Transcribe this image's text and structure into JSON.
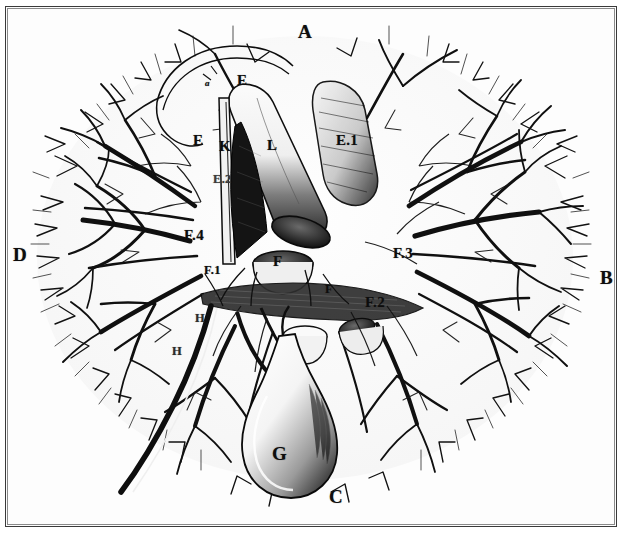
{
  "plate": {
    "kind": "anatomical-engraving",
    "subject": "Liver with hepatic vascular tree and gallbladder",
    "background_color": "#ffffff",
    "ink_color": "#101010",
    "frame_color": "#3a3a3a"
  },
  "labels": {
    "top": {
      "text": "A",
      "x": 298,
      "y": 22
    },
    "right": {
      "text": "B",
      "x": 600,
      "y": 268
    },
    "bottom": {
      "text": "C",
      "x": 329,
      "y": 487
    },
    "left": {
      "text": "D",
      "x": 13,
      "y": 245
    },
    "lobe_e_top": {
      "text": "E",
      "x": 237,
      "y": 73
    },
    "lobe_e_left": {
      "text": "E",
      "x": 193,
      "y": 133
    },
    "duct_e1": {
      "text": "E.1",
      "x": 336,
      "y": 133
    },
    "duct_e2": {
      "text": "E.2",
      "x": 213,
      "y": 173
    },
    "vessel_l": {
      "text": "L",
      "x": 267,
      "y": 138
    },
    "vessel_k": {
      "text": "K",
      "x": 219,
      "y": 139
    },
    "marker_a": {
      "text": "a",
      "x": 205,
      "y": 79
    },
    "branch_f": {
      "text": "F",
      "x": 273,
      "y": 254
    },
    "branch_f_right": {
      "text": "F",
      "x": 325,
      "y": 283
    },
    "branch_f1": {
      "text": "F.1",
      "x": 204,
      "y": 264
    },
    "branch_f2": {
      "text": "F.2",
      "x": 365,
      "y": 295
    },
    "branch_f3": {
      "text": "F.3",
      "x": 393,
      "y": 246
    },
    "branch_f4": {
      "text": "F.4",
      "x": 184,
      "y": 228
    },
    "gallbladder_g": {
      "text": "G",
      "x": 272,
      "y": 444
    },
    "duct_h_upper": {
      "text": "H",
      "x": 195,
      "y": 312
    },
    "duct_h_lower": {
      "text": "H",
      "x": 172,
      "y": 345
    }
  },
  "caption_legend": [
    "A",
    "B",
    "C",
    "D",
    "E",
    "E.1",
    "E.2",
    "F",
    "F.1",
    "F.2",
    "F.3",
    "F.4",
    "G",
    "H",
    "K",
    "L",
    "a"
  ]
}
